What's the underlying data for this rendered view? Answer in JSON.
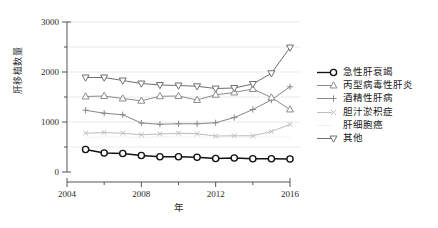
{
  "chart_data": {
    "type": "line",
    "title": "",
    "xlabel": "年",
    "ylabel": "肝移植数量",
    "xlim": [
      2004,
      2016
    ],
    "ylim": [
      0,
      3000
    ],
    "xticks": [
      2004,
      2008,
      2012,
      2016
    ],
    "xticks_minor": [
      2006,
      2010,
      2014
    ],
    "yticks": [
      0,
      1000,
      2000,
      3000
    ],
    "yticks_minor": [
      500,
      1500,
      2500
    ],
    "grid": "horizontal gridlines at every 500",
    "legend_position": "right",
    "x": [
      2005,
      2006,
      2007,
      2008,
      2009,
      2010,
      2011,
      2012,
      2013,
      2014,
      2015,
      2016
    ],
    "series": [
      {
        "name": "急性肝衰竭",
        "marker": "circle",
        "color": "#111111",
        "values": [
          450,
          380,
          370,
          330,
          305,
          305,
          295,
          270,
          280,
          265,
          265,
          260
        ]
      },
      {
        "name": "丙型病毒性肝炎",
        "marker": "triangle-up",
        "color": "#8c8c8c",
        "values": [
          1510,
          1520,
          1470,
          1425,
          1515,
          1520,
          1440,
          1545,
          1590,
          1660,
          1490,
          1250
        ]
      },
      {
        "name": "酒精性肝病",
        "marker": "plus",
        "color": "#888888",
        "values": [
          1235,
          1175,
          1145,
          980,
          955,
          965,
          965,
          985,
          1090,
          1250,
          1440,
          1705
        ]
      },
      {
        "name": "胆汁淤积症",
        "marker": "x",
        "color": "#bdbdbd",
        "values": [
          775,
          790,
          775,
          745,
          760,
          775,
          765,
          720,
          725,
          725,
          810,
          950
        ]
      },
      {
        "name": "肝细胞癌",
        "marker": "none",
        "color": "#f2f2f2",
        "values": [
          690,
          700,
          700,
          690,
          700,
          700,
          700,
          695,
          700,
          700,
          700,
          700
        ]
      },
      {
        "name": "其他",
        "marker": "triangle-down",
        "color": "#6f6f6f",
        "values": [
          1890,
          1890,
          1830,
          1770,
          1740,
          1730,
          1715,
          1670,
          1680,
          1760,
          1975,
          2490
        ]
      }
    ]
  },
  "legend": {
    "items": [
      {
        "label": "急性肝衰竭"
      },
      {
        "label": "丙型病毒性肝炎"
      },
      {
        "label": "酒精性肝病"
      },
      {
        "label": "胆汁淤积症"
      },
      {
        "label": "肝细胞癌"
      },
      {
        "label": "其他"
      }
    ]
  },
  "axes": {
    "y_title": "肝移植数量",
    "x_title": "年",
    "y_tick_labels": [
      "0",
      "1000",
      "2000",
      "3000"
    ],
    "x_tick_labels": [
      "2004",
      "2008",
      "2012",
      "2016"
    ]
  }
}
